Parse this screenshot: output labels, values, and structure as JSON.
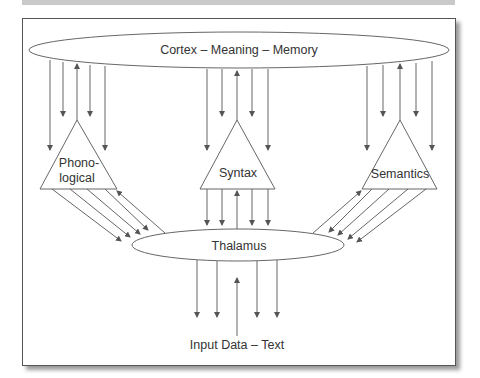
{
  "diagram": {
    "nodes": {
      "cortex": {
        "label": "Cortex – Meaning – Memory",
        "shape": "ellipse"
      },
      "phonological": {
        "label_line1": "Phono-",
        "label_line2": "logical",
        "shape": "triangle"
      },
      "syntax": {
        "label": "Syntax",
        "shape": "triangle"
      },
      "semantics": {
        "label": "Semantics",
        "shape": "triangle"
      },
      "thalamus": {
        "label": "Thalamus",
        "shape": "ellipse"
      },
      "input": {
        "label": "Input Data – Text",
        "shape": "text"
      }
    },
    "edges": [
      {
        "from": "cortex",
        "to": "phonological",
        "down_arrows": 4,
        "up_arrows": 1
      },
      {
        "from": "cortex",
        "to": "syntax",
        "down_arrows": 4,
        "up_arrows": 1
      },
      {
        "from": "cortex",
        "to": "semantics",
        "down_arrows": 4,
        "up_arrows": 1
      },
      {
        "from": "phonological",
        "to": "thalamus",
        "down_arrows": 4,
        "up_arrows": 1
      },
      {
        "from": "syntax",
        "to": "thalamus",
        "down_arrows": 4,
        "up_arrows": 1
      },
      {
        "from": "semantics",
        "to": "thalamus",
        "down_arrows": 4,
        "up_arrows": 1
      },
      {
        "from": "thalamus",
        "to": "input",
        "down_arrows": 4,
        "up_arrows": 1
      }
    ],
    "colors": {
      "stroke": "#555555",
      "text": "#333333",
      "background": "#ffffff"
    }
  }
}
